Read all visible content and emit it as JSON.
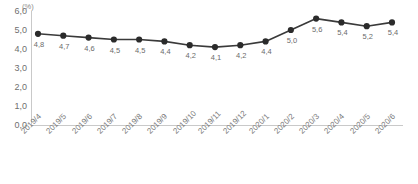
{
  "chart_data": {
    "type": "line",
    "title": "",
    "subtitle": "",
    "xlabel": "",
    "ylabel": "",
    "unit_label": "(%)",
    "categories": [
      "2019/4",
      "2019/5",
      "2019/6",
      "2019/7",
      "2019/8",
      "2019/9",
      "2019/10",
      "2019/11",
      "2019/12",
      "2020/1",
      "2020/2",
      "2020/3",
      "2020/4",
      "2020/5",
      "2020/6"
    ],
    "values": [
      4.8,
      4.7,
      4.6,
      4.5,
      4.5,
      4.4,
      4.2,
      4.1,
      4.2,
      4.4,
      5.0,
      5.6,
      5.4,
      5.2,
      5.4
    ],
    "point_labels": [
      "4,8",
      "4,7",
      "4,6",
      "4,5",
      "4,5",
      "4,4",
      "4,2",
      "4,1",
      "4,2",
      "4,4",
      "5,0",
      "5,6",
      "5,4",
      "5,2",
      "5,4"
    ],
    "ylim": [
      0,
      6
    ],
    "ytick_values": [
      6.0,
      5.0,
      4.0,
      3.0,
      2.0,
      1.0,
      0.0
    ],
    "ytick_labels": [
      "6,0",
      "5,0",
      "4,0",
      "3,0",
      "2,0",
      "1,0",
      "0,0"
    ],
    "grid": false,
    "legend": "none",
    "series_color": "#3a3a3a",
    "marker": "circle",
    "marker_color": "#2b2b2b",
    "axis_color": "#c9c9c9",
    "text_color": "#6f6f6f"
  }
}
